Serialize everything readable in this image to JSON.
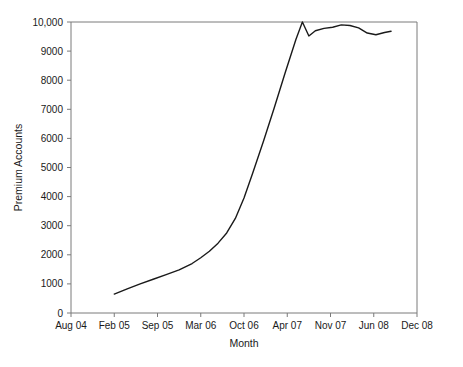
{
  "chart_data": {
    "type": "line",
    "title": "",
    "xlabel": "Month",
    "ylabel": "Premium Accounts",
    "grid": false,
    "legend": "none",
    "xlim": [
      0,
      8
    ],
    "ylim": [
      0,
      10000
    ],
    "x_tick_labels": [
      "Aug 04",
      "Feb 05",
      "Sep 05",
      "Mar 06",
      "Oct 06",
      "Apr 07",
      "Nov 07",
      "Jun 08",
      "Dec 08"
    ],
    "y_tick_labels": [
      "0",
      "1000",
      "2000",
      "3000",
      "4000",
      "5000",
      "6000",
      "7000",
      "8000",
      "9000",
      "10,000"
    ],
    "y_tick_values": [
      0,
      1000,
      2000,
      3000,
      4000,
      5000,
      6000,
      7000,
      8000,
      9000,
      10000
    ],
    "series": [
      {
        "name": "Premium Accounts",
        "color": "#1a1a1a",
        "x": [
          1.0,
          1.3,
          1.6,
          1.9,
          2.2,
          2.5,
          2.8,
          3.0,
          3.2,
          3.4,
          3.6,
          3.8,
          4.0,
          4.2,
          4.45,
          4.7,
          4.95,
          5.2,
          5.35,
          5.5,
          5.65,
          5.85,
          6.05,
          6.25,
          6.45,
          6.65,
          6.85,
          7.05,
          7.25,
          7.4
        ],
        "y": [
          650,
          830,
          1000,
          1160,
          1320,
          1480,
          1700,
          1900,
          2120,
          2400,
          2750,
          3250,
          3950,
          4800,
          5900,
          7050,
          8250,
          9400,
          10000,
          9520,
          9700,
          9780,
          9820,
          9900,
          9880,
          9800,
          9620,
          9560,
          9640,
          9680
        ]
      }
    ],
    "annotations": {
      "peak_value": 10000,
      "peak_month": "Apr 07",
      "start_value": 650,
      "start_month": "Feb 05",
      "end_value": 9680
    },
    "axis_color": "#7a7a7a",
    "line_color": "#1a1a1a"
  }
}
